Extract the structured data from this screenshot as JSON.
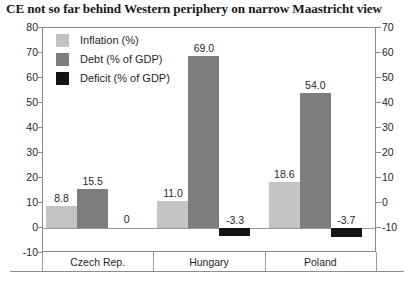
{
  "chart_data": {
    "type": "bar",
    "title": "CE not so far behind Western periphery on narrow Maastricht view",
    "xlabel": "",
    "ylabel": "",
    "categories": [
      "Czech Rep.",
      "Hungary",
      "Poland"
    ],
    "series": [
      {
        "name": "Inflation (%)",
        "color": "#c3c3c3",
        "values": [
          8.8,
          11.0,
          18.6
        ],
        "labels": [
          "8.8",
          "11.0",
          "18.6"
        ]
      },
      {
        "name": "Debt (% of GDP)",
        "color": "#7d7d7d",
        "values": [
          15.5,
          69.0,
          54.0
        ],
        "labels": [
          "15.5",
          "69.0",
          "54.0"
        ]
      },
      {
        "name": "Deficit (% of GDP)",
        "color": "#141414",
        "values": [
          0,
          -3.3,
          -3.7
        ],
        "labels": [
          "0",
          "-3.3",
          "-3.7"
        ]
      }
    ],
    "ylim": [
      -10,
      80
    ],
    "ylim_right": [
      -10,
      70
    ],
    "yticks_left": [
      "80",
      "70",
      "60",
      "50",
      "40",
      "30",
      "20",
      "10",
      "0",
      "-10"
    ],
    "yticks_right": [
      "70",
      "60",
      "50",
      "40",
      "30",
      "20",
      "10",
      "0",
      "-10"
    ],
    "grid": false,
    "legend_position": "top-left",
    "axis_color": "#8a8a8a",
    "background": "#ffffff"
  }
}
